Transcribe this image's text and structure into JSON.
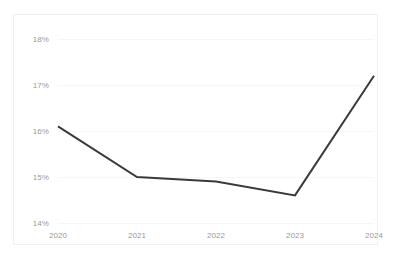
{
  "chart_data": {
    "type": "line",
    "title": "",
    "subtitle": "",
    "xlabel": "",
    "ylabel": "",
    "categories": [
      "2020",
      "2021",
      "2022",
      "2023",
      "2024"
    ],
    "x": [
      2020,
      2021,
      2022,
      2023,
      2024
    ],
    "series": [
      {
        "name": "",
        "values": [
          16.1,
          15.0,
          14.9,
          14.6,
          17.2
        ],
        "color": "#3a3a3a",
        "line_width": 2,
        "markers": false
      }
    ],
    "ylim": [
      14,
      18
    ],
    "yticks": [
      14,
      15,
      16,
      17,
      18
    ],
    "ytick_labels": [
      "14%",
      "15%",
      "16%",
      "17%",
      "18%"
    ],
    "xtick_labels": [
      "2020",
      "2021",
      "2022",
      "2023",
      "2024"
    ],
    "grid": true,
    "grid_axis": "y",
    "grid_color": "#f6f6f6",
    "legend": false,
    "legend_position": "none",
    "axis_label_color": "#9a9a9a",
    "background_color": "#ffffff",
    "border_color": "#f0f0f0",
    "annotations": []
  }
}
